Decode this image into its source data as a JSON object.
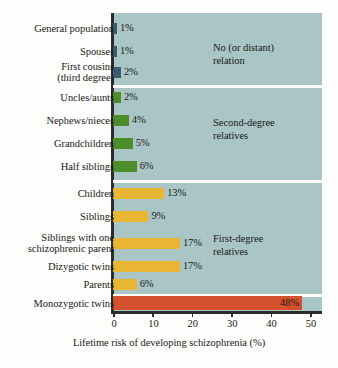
{
  "chart_data": {
    "type": "bar",
    "title": "",
    "xlabel": "Lifetime risk of developing schizophrenia (%)",
    "ylabel": "",
    "orientation": "horizontal",
    "xlim": [
      0,
      53
    ],
    "xticks": [
      0,
      10,
      20,
      30,
      40,
      50
    ],
    "xticklabels": [
      "0",
      "10",
      "20",
      "30",
      "40",
      "50"
    ],
    "grid": false,
    "legend": "none",
    "plot_background": "#a9c5c5",
    "categories": [
      "General population",
      "Spouses",
      "First cousins\n(third degree)",
      "Uncles/aunts",
      "Nephews/nieces",
      "Grandchildren",
      "Half siblings",
      "Children",
      "Siblings",
      "Siblings with one\nschizophrenic parent",
      "Dizygotic twins",
      "Parents",
      "Monozygotic twins"
    ],
    "values": [
      1,
      1,
      2,
      2,
      4,
      5,
      6,
      13,
      9,
      17,
      17,
      6,
      48
    ],
    "value_labels": [
      "1%",
      "1%",
      "2%",
      "2%",
      "4%",
      "5%",
      "6%",
      "13%",
      "9%",
      "17%",
      "17%",
      "6%",
      "48%"
    ],
    "bar_colors": [
      "#3d5b6e",
      "#3d5b6e",
      "#3d5b6e",
      "#4d8c2b",
      "#4d8c2b",
      "#4d8c2b",
      "#4d8c2b",
      "#e8b633",
      "#e8b633",
      "#e8b633",
      "#e8b633",
      "#e8b633",
      "#d6512e"
    ],
    "groups": [
      {
        "label": "No (or distant)\nrelation",
        "start": 0,
        "end": 2,
        "color": "#3d5b6e"
      },
      {
        "label": "Second-degree\nrelatives",
        "start": 3,
        "end": 6,
        "color": "#4d8c2b"
      },
      {
        "label": "First-degree\nrelatives",
        "start": 7,
        "end": 11,
        "color": "#e8b633"
      },
      {
        "label": "",
        "start": 12,
        "end": 12,
        "color": "#d6512e"
      }
    ]
  }
}
